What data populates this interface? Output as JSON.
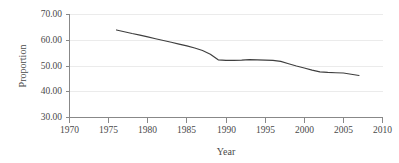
{
  "chart_data": {
    "type": "line",
    "title": "",
    "xlabel": "Year",
    "ylabel": "Proportion",
    "xlim": [
      1970,
      2010
    ],
    "ylim": [
      30,
      70
    ],
    "grid": true,
    "legend": false,
    "series_color": "#3f3f3f",
    "x_ticks": [
      1970,
      1975,
      1980,
      1985,
      1990,
      1995,
      2000,
      2005,
      2010
    ],
    "x_tick_labels": [
      "1970",
      "1975",
      "1980",
      "1985",
      "1990",
      "1995",
      "2000",
      "2005",
      "2010"
    ],
    "y_ticks": [
      30,
      40,
      50,
      60,
      70
    ],
    "y_tick_labels": [
      "30.00",
      "40.00",
      "50.00",
      "60.00",
      "70.00"
    ],
    "series": [
      {
        "name": "Proportion",
        "x": [
          1976,
          1977,
          1978,
          1979,
          1980,
          1981,
          1982,
          1983,
          1984,
          1985,
          1986,
          1987,
          1988,
          1989,
          1990,
          1991,
          1992,
          1993,
          1994,
          1995,
          1996,
          1997,
          1998,
          1999,
          2000,
          2001,
          2002,
          2003,
          2004,
          2005,
          2006,
          2007
        ],
        "values": [
          64.0,
          63.3,
          62.6,
          62.0,
          61.3,
          60.6,
          59.9,
          59.2,
          58.5,
          57.8,
          57.0,
          56.0,
          54.6,
          52.4,
          52.2,
          52.2,
          52.3,
          52.5,
          52.4,
          52.3,
          52.2,
          51.8,
          50.9,
          50.0,
          49.2,
          48.4,
          47.7,
          47.5,
          47.4,
          47.3,
          46.8,
          46.3
        ]
      }
    ]
  }
}
